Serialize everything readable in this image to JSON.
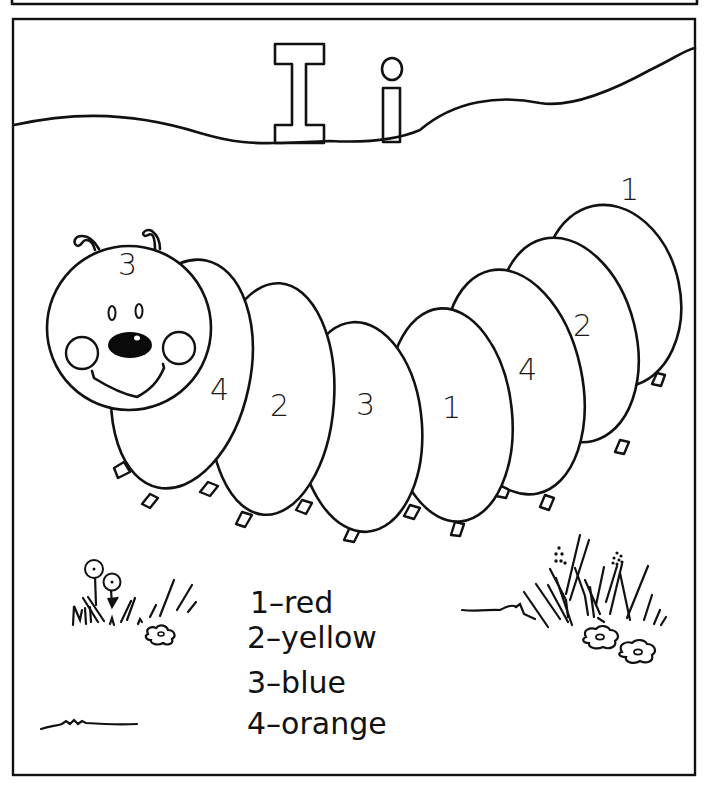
{
  "worksheet": {
    "type": "color-by-number",
    "letter_upper": "I",
    "letter_lower": "i",
    "head_number": "3",
    "segments": [
      {
        "number": "4"
      },
      {
        "number": "2"
      },
      {
        "number": "3"
      },
      {
        "number": "1"
      },
      {
        "number": "4"
      },
      {
        "number": "2"
      },
      {
        "number": "1"
      }
    ],
    "legend": [
      {
        "number": "1",
        "color_name": "red",
        "text": "1–red"
      },
      {
        "number": "2",
        "color_name": "yellow",
        "text": "2–yellow"
      },
      {
        "number": "3",
        "color_name": "blue",
        "text": "3–blue"
      },
      {
        "number": "4",
        "color_name": "orange",
        "text": "4–orange"
      }
    ],
    "colors": {
      "ink": "#111111",
      "paper": "#ffffff"
    }
  }
}
